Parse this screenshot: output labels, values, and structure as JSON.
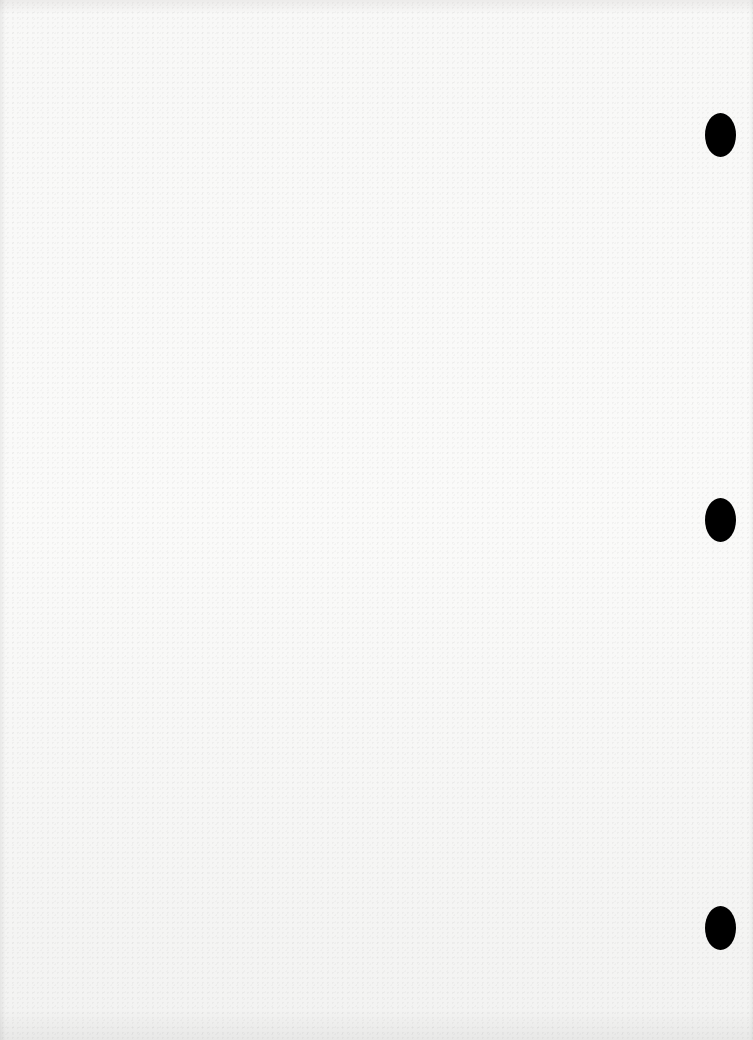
{
  "document": {
    "type": "blank-scanned-page",
    "text": "",
    "colors": {
      "paper": "#f7f7f6",
      "punch_hole": "#000000"
    },
    "punch_holes": [
      {
        "position": "top",
        "x": 720,
        "y": 135
      },
      {
        "position": "middle",
        "x": 720,
        "y": 520
      },
      {
        "position": "bottom",
        "x": 720,
        "y": 928
      }
    ]
  }
}
